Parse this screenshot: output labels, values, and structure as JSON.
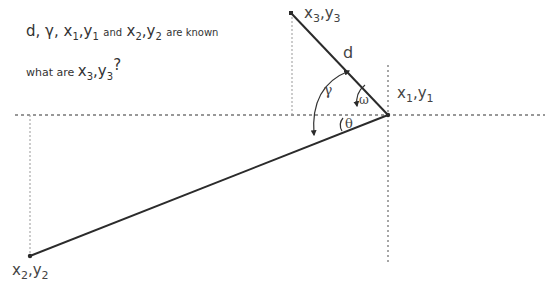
{
  "problem": {
    "line1": {
      "knowns": [
        "d",
        "γ"
      ],
      "p1": {
        "x": "x",
        "xsub": "1",
        "y": "y",
        "ysub": "1"
      },
      "and": "and",
      "p2": {
        "x": "x",
        "xsub": "2",
        "y": "y",
        "ysub": "2"
      },
      "suffix": "are known"
    },
    "line2": {
      "prefix": "what are",
      "p3": {
        "x": "x",
        "xsub": "3",
        "y": "y",
        "ysub": "3"
      },
      "suffix": "?"
    }
  },
  "points": {
    "p1": {
      "px": 388,
      "py": 115,
      "label_x": "x",
      "label_xsub": "1",
      "label_y": "y",
      "label_ysub": "1"
    },
    "p2": {
      "px": 30,
      "py": 256,
      "label_x": "x",
      "label_xsub": "2",
      "label_y": "y",
      "label_ysub": "2"
    },
    "p3": {
      "px": 291,
      "py": 13,
      "label_x": "x",
      "label_xsub": "3",
      "label_y": "y",
      "label_ysub": "3"
    }
  },
  "segments": [
    {
      "name": "segment-d",
      "from": "p1",
      "to": "p3",
      "label": "d"
    },
    {
      "name": "segment-p1-p2",
      "from": "p1",
      "to": "p2",
      "label": ""
    }
  ],
  "guides": {
    "horizontal": {
      "y": 115,
      "x1": 15,
      "x2": 545
    },
    "vertical_p1": {
      "x": 388,
      "y1": 65,
      "y2": 262
    },
    "vertical_p2": {
      "x": 30,
      "y1": 115,
      "y2": 256
    },
    "vertical_p3": {
      "x": 292,
      "y1": 13,
      "y2": 115
    }
  },
  "angles": {
    "gamma": {
      "symbol": "γ"
    },
    "omega": {
      "symbol": "ω"
    },
    "theta": {
      "symbol": "θ"
    }
  },
  "colors": {
    "line": "#2b2b2b",
    "guide": "#777777",
    "text": "#333333"
  }
}
